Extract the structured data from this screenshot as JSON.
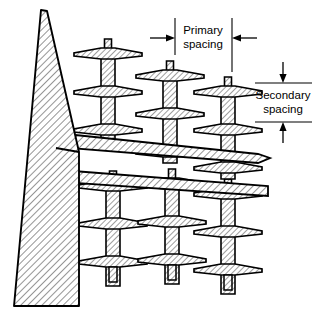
{
  "figure": {
    "type": "engineering-line-drawing",
    "background_color": "#ffffff",
    "line_color": "#000000",
    "hatch_color": "#2b2b2b",
    "fill_color": "#ffffff"
  },
  "annotations": {
    "primary": {
      "line1": "Primary",
      "line2": "spacing",
      "arrow_direction": "horizontal-inward",
      "extension_line_left_x": 175,
      "extension_line_right_x": 232,
      "label_x": 203,
      "label_y_line1": 33,
      "label_y_line2": 47
    },
    "secondary": {
      "line1": "Secondary",
      "line2": "spacing",
      "arrow_direction": "vertical-inward",
      "boundary_line_top_y": 83,
      "boundary_line_bottom_y": 122,
      "label_x": 283,
      "label_y_line1": 98,
      "label_y_line2": 112
    }
  },
  "structure": {
    "mast": {
      "name": "tapered-pole",
      "apex_x": 43,
      "apex_y": 10,
      "base_left_x": 14,
      "base_right_x": 79,
      "base_y": 306,
      "shoulder_y": 152
    },
    "crossarms": [
      {
        "name": "upper-crossarm",
        "y_top": 150,
        "y_bottom": 172,
        "x_left": 56,
        "x_right": 270
      },
      {
        "name": "lower-crossarm",
        "y_top": 296,
        "y_bottom": 316,
        "x_left": 60,
        "x_right": 268
      }
    ],
    "insulator_strings_upper": [
      {
        "id": "upper-string-1",
        "cx": 108,
        "cap_y": 46,
        "discs": 3
      },
      {
        "id": "upper-string-2",
        "cx": 170,
        "cap_y": 68,
        "discs": 3
      },
      {
        "id": "upper-string-3",
        "cx": 228,
        "cap_y": 84,
        "discs": 3
      }
    ],
    "insulator_strings_lower": [
      {
        "id": "lower-string-1",
        "cx": 113,
        "cap_y": 178,
        "discs": 3
      },
      {
        "id": "lower-string-2",
        "cx": 172,
        "cap_y": 176,
        "discs": 3
      },
      {
        "id": "lower-string-3",
        "cx": 228,
        "cap_y": 186,
        "discs": 3
      }
    ]
  }
}
